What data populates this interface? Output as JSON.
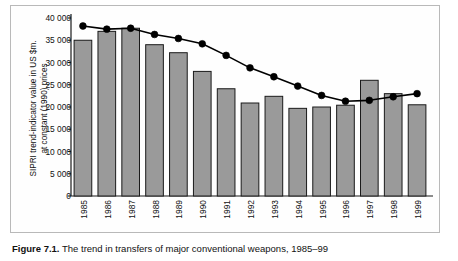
{
  "figure": {
    "caption_label": "Figure 7.1.",
    "caption_text": "The trend in transfers of major conventional weapons, 1985–99"
  },
  "axis": {
    "y_title": "SIPRI trend-indicator value in US $m.\nat constant (1990) prices",
    "y_ticks": [
      "0",
      "5 000",
      "10 000",
      "15 000",
      "20 000",
      "25 000",
      "30 000",
      "35 000",
      "40 000"
    ],
    "y_tick_values": [
      0,
      5000,
      10000,
      15000,
      20000,
      25000,
      30000,
      35000,
      40000
    ],
    "x_ticks": [
      "1985",
      "1986",
      "1987",
      "1988",
      "1989",
      "1990",
      "1991",
      "1992",
      "1993",
      "1994",
      "1995",
      "1996",
      "1997",
      "1998",
      "1999"
    ]
  },
  "colors": {
    "bar_fill": "#9a9a9a",
    "bar_stroke": "#1a1a1a",
    "line": "#000000",
    "marker": "#000000",
    "axis": "#1a1a1a",
    "frame": "#b9b9b9"
  },
  "chart_data": {
    "type": "bar",
    "title": "",
    "xlabel": "",
    "ylabel": "SIPRI trend-indicator value in US $m. at constant (1990) prices",
    "ylim": [
      0,
      40000
    ],
    "ytick_step": 5000,
    "grid": false,
    "legend": "none",
    "categories": [
      "1985",
      "1986",
      "1987",
      "1988",
      "1989",
      "1990",
      "1991",
      "1992",
      "1993",
      "1994",
      "1995",
      "1996",
      "1997",
      "1998",
      "1999"
    ],
    "series": [
      {
        "name": "Annual value of transfers",
        "type": "bar",
        "values": [
          35000,
          37000,
          37700,
          34000,
          32200,
          28000,
          24100,
          20900,
          22400,
          19700,
          20000,
          20400,
          26000,
          23000,
          20500
        ]
      },
      {
        "name": "Five-year moving average trend",
        "type": "line",
        "values": [
          38200,
          37500,
          37700,
          36300,
          35400,
          34200,
          31600,
          28800,
          26800,
          24700,
          22600,
          21300,
          21500,
          22300,
          23000
        ]
      }
    ]
  }
}
